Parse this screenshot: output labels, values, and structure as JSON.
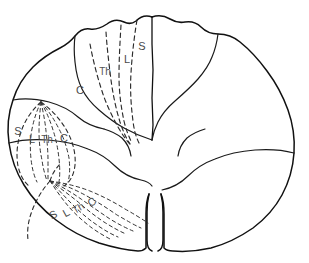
{
  "figure": {
    "background_color": "#ffffff",
    "ink_color": "#111111",
    "label_color": "#4a4a4a",
    "width": 309,
    "height": 263
  },
  "legend_keys": {
    "cervical": "C",
    "thoracic": "Th",
    "lumbar": "L",
    "sacral": "S"
  },
  "regions": [
    {
      "id": "dorsal-column",
      "name": "dorsal-funiculus",
      "labels": [
        {
          "text": "C",
          "x": 80,
          "y": 94,
          "rotate": 0
        },
        {
          "text": "Th",
          "x": 105,
          "y": 75,
          "rotate": 0
        },
        {
          "text": "L",
          "x": 127,
          "y": 63,
          "rotate": 0
        },
        {
          "text": "S",
          "x": 142,
          "y": 50,
          "rotate": 0
        }
      ]
    },
    {
      "id": "lateral-column",
      "name": "lateral-funiculus",
      "labels": [
        {
          "text": "S",
          "x": 18,
          "y": 135,
          "rotate": 0
        },
        {
          "text": "L",
          "x": 32,
          "y": 143,
          "rotate": 0
        },
        {
          "text": "Th",
          "x": 47,
          "y": 143,
          "rotate": 0
        },
        {
          "text": "C",
          "x": 64,
          "y": 142,
          "rotate": 0
        }
      ]
    },
    {
      "id": "ventral-column",
      "name": "ventral-funiculus",
      "labels": [
        {
          "text": "S",
          "x": 55,
          "y": 218,
          "rotate": -28
        },
        {
          "text": "L",
          "x": 68,
          "y": 216,
          "rotate": -28
        },
        {
          "text": "Th",
          "x": 80,
          "y": 211,
          "rotate": -32
        },
        {
          "text": "C",
          "x": 94,
          "y": 205,
          "rotate": -35
        }
      ]
    }
  ],
  "strokes": {
    "cord_outline": "M 152 17 C 146 15 140 17 136 21 C 132 24 128 24 124 22 C 118 19 112 20 107 24 C 101 28 96 30 90 29 C 84 28 79 31 75 36 C 71 41 66 45 60 48 C 50 53 41 59 33 67 C 24 76 17 87 13 100 C 8 114 7 129 9 143 C 11 158 16 172 24 185 C 32 198 43 210 56 220 C 69 230 84 238 99 243 C 112 247 125 250 138 251 C 141 251 144 250 146 248 L 146 214 C 146 206 147 199 149 194",
    "cord_outline_right": "M 152 17 C 158 15 165 16 170 19 C 175 22 180 23 185 22 C 191 21 197 23 201 27 C 206 32 212 34 218 34 C 226 34 234 37 240 42 C 250 50 259 60 267 71 C 276 83 283 96 288 110 C 293 124 295 139 294 153 C 293 168 289 182 282 195 C 275 208 265 219 253 228 C 240 237 226 244 211 248 C 198 251 185 252 173 251 C 169 251 166 250 164 248 L 164 214 C 164 206 163 199 161 194",
    "dorsal_median_septum": "M 152 17 L 152 44 L 153 70 L 152 98 L 153 125 L 152 140",
    "ventral_fissure_left": "M 149 194 C 148 198 147 205 147 212 L 147 240 C 147 246 149 250 152 251",
    "ventral_fissure_right": "M 161 194 C 162 198 163 205 163 212 L 163 240 C 163 246 161 250 158 251",
    "gray_left": "M 9 143 C 20 140 34 139 48 140 C 62 141 76 144 88 149 C 99 153 108 159 115 166 C 122 173 131 178 141 180 C 146 181 150 183 152 186",
    "gray_right": "M 294 153 C 283 150 269 149 255 150 C 241 151 227 154 215 159 C 204 163 195 169 188 176 C 181 183 172 188 162 190",
    "sulcus_upper_left": "M 75 36 C 74 44 74 53 75 62 C 76 72 78 81 82 89 C 86 97 92 104 99 110 C 107 117 115 123 124 128 C 133 133 142 137 152 140",
    "sulcus_upper_right": "M 218 34 C 217 42 215 50 212 57 C 209 65 204 72 198 79 C 191 87 183 94 175 101 C 168 107 162 114 158 122 C 155 128 153 134 152 140",
    "horn_notch_left": "M 13 100 C 24 98 37 99 49 102 C 60 105 70 110 78 117 C 85 123 94 127 104 129",
    "mid_inner_left": "M 104 129 C 111 131 117 134 122 138 C 127 143 130 149 131 156",
    "mid_inner_right": "M 205 129 C 198 131 192 134 187 138 C 182 143 179 149 178 156"
  },
  "dorsal_fan": [
    "M 106 32 C 107 48 109 64 111 80 C 113 95 116 109 120 122 C 123 131 126 138 130 144",
    "M 121 25 C 120 42 119 59 119 76 C 119 92 121 107 124 121 C 126 130 129 137 132 143",
    "M 137 20 C 134 38 132 56 131 73 C 130 90 131 106 133 121 C 134 130 136 137 139 143",
    "M 90 44 C 93 60 97 76 102 91 C 106 104 112 116 118 127 C 122 134 126 140 130 144"
  ],
  "lateral_fan": [
    "M 41 102 C 37 110 34 119 32 129 C 30 139 30 149 31 159 C 32 168 34 176 37 182",
    "M 41 102 C 40 111 39 121 39 131 C 39 141 40 151 42 160 C 43 168 45 175 47 181",
    "M 41 102 C 43 111 45 121 46 131 C 47 141 48 151 48 160 C 48 168 48 175 48 181",
    "M 41 102 C 46 111 50 120 53 130 C 56 139 58 149 59 159 C 60 168 60 176 59 182",
    "M 41 102 C 48 110 54 119 59 129 C 64 138 67 148 69 158 C 70 167 70 175 68 182"
  ],
  "lateral_lens": [
    "M 41 102 C 32 110 25 120 21 132 C 17 143 16 155 18 166 C 20 175 24 182 29 186",
    "M 41 102 C 52 110 61 120 67 131 C 73 142 76 154 75 165 C 74 175 70 182 64 186"
  ],
  "ventral_fan": [
    "M 50 181 C 56 190 62 199 69 207 C 76 215 84 222 92 228 C 99 233 106 237 112 240",
    "M 50 181 C 57 188 64 196 72 204 C 80 212 88 219 97 225 C 104 230 111 234 118 237",
    "M 50 181 C 59 187 68 194 77 201 C 86 209 95 216 104 222 C 112 227 119 231 126 234",
    "M 50 181 C 61 186 71 192 81 199 C 91 206 101 213 110 219 C 118 224 126 228 133 231",
    "M 50 181 C 62 184 74 189 85 195 C 96 201 107 208 117 215 C 126 220 134 225 141 228",
    "M 50 181 C 64 183 77 186 90 191 C 102 196 114 202 125 209 C 134 214 142 219 148 223"
  ],
  "ventral_edges": [
    "M 50 181 C 42 190 36 200 32 211 C 28 221 27 231 28 240",
    "M 50 181 C 52 174 56 168 61 163"
  ]
}
